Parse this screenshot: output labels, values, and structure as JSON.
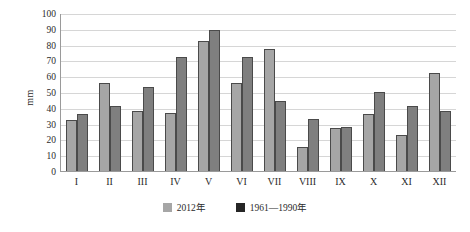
{
  "chart_data": {
    "type": "bar",
    "title": "",
    "xlabel": "",
    "ylabel": "mm",
    "ylim": [
      0,
      100
    ],
    "ytick_step": 10,
    "grid": true,
    "legend_position": "bottom",
    "categories": [
      "I",
      "II",
      "III",
      "IV",
      "V",
      "VI",
      "VII",
      "VIII",
      "IX",
      "X",
      "XI",
      "XII"
    ],
    "yticks": [
      "0",
      "10",
      "20",
      "30",
      "40",
      "50",
      "60",
      "70",
      "80",
      "90",
      "100"
    ],
    "series": [
      {
        "name": "2012年",
        "color": "#a6a6a6",
        "legend_swatch_color": "#a6a6a6",
        "values": [
          32,
          56,
          38,
          37,
          82,
          56,
          77,
          15,
          27,
          36,
          23,
          62
        ]
      },
      {
        "name": "1961—1990年",
        "color": "#7f7f7f",
        "legend_swatch_color": "#262626",
        "values": [
          36,
          41,
          53,
          72,
          89,
          72,
          44,
          33,
          28,
          50,
          41,
          38
        ]
      }
    ]
  }
}
